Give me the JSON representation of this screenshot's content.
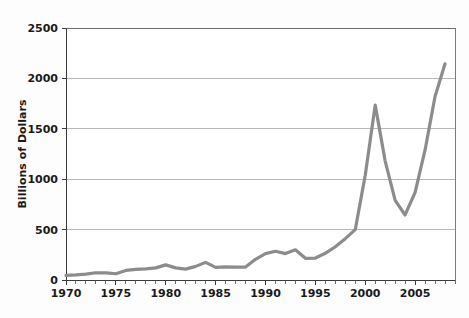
{
  "chart_data": {
    "type": "line",
    "title": "",
    "xlabel": "",
    "ylabel": "Billions of Dollars",
    "xlim": [
      1970,
      2009
    ],
    "ylim": [
      0,
      2500
    ],
    "grid": true,
    "legend": "none",
    "line_color": "#8c8c8c",
    "x_tick_labels": [
      "1970",
      "1975",
      "1980",
      "1985",
      "1990",
      "1995",
      "2000",
      "2005"
    ],
    "x_tick_values": [
      1970,
      1975,
      1980,
      1985,
      1990,
      1995,
      2000,
      2005
    ],
    "x_minor_step": 1,
    "y_tick_labels": [
      "0",
      "500",
      "1000",
      "1500",
      "2000",
      "2500"
    ],
    "y_tick_values": [
      0,
      500,
      1000,
      1500,
      2000,
      2500
    ],
    "series": [
      {
        "name": "Value",
        "x": [
          1970,
          1971,
          1972,
          1973,
          1974,
          1975,
          1976,
          1977,
          1978,
          1979,
          1980,
          1981,
          1982,
          1983,
          1984,
          1985,
          1986,
          1987,
          1988,
          1989,
          1990,
          1991,
          1992,
          1993,
          1994,
          1995,
          1996,
          1997,
          1998,
          1999,
          2000,
          2001,
          2002,
          2003,
          2004,
          2005,
          2006,
          2007,
          2008
        ],
        "values": [
          45,
          50,
          58,
          72,
          70,
          62,
          95,
          105,
          110,
          120,
          150,
          120,
          108,
          135,
          175,
          125,
          130,
          128,
          128,
          205,
          262,
          285,
          262,
          300,
          215,
          218,
          265,
          330,
          410,
          500,
          1040,
          1735,
          1180,
          790,
          645,
          870,
          1290,
          1820,
          2145
        ]
      }
    ],
    "annotations": []
  },
  "axis": {
    "y_title": "Billions of Dollars"
  }
}
